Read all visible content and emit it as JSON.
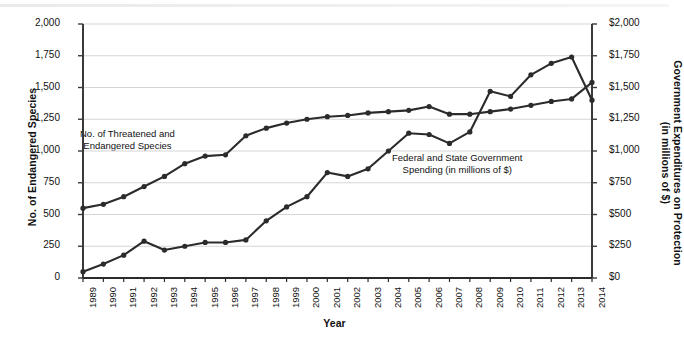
{
  "chart_data": {
    "type": "line",
    "title": "",
    "xlabel": "Year",
    "ylabel": "No. of Endangered Species",
    "ylabel_right": "Government Expenditures on Protection (in millions of $)",
    "grid": true,
    "legend": "inline-annotations",
    "ylim": [
      0,
      2000
    ],
    "ylim_right": [
      0,
      2000
    ],
    "ytick_labels": [
      "2,000",
      "1,750",
      "1,500",
      "1,250",
      "1,000",
      "750",
      "500",
      "250",
      "0"
    ],
    "ytick_values": [
      2000,
      1750,
      1500,
      1250,
      1000,
      750,
      500,
      250,
      0
    ],
    "ytick_labels_right": [
      "$2,000",
      "$1,750",
      "$1,500",
      "$1,250",
      "$1,000",
      "$750",
      "$500",
      "$250",
      "$0"
    ],
    "categories": [
      "1989",
      "1990",
      "1991",
      "1992",
      "1993",
      "1994",
      "1995",
      "1996",
      "1997",
      "1998",
      "1999",
      "2000",
      "2001",
      "2002",
      "2003",
      "2004",
      "2005",
      "2006",
      "2007",
      "2008",
      "2009",
      "2010",
      "2011",
      "2012",
      "2013",
      "2014"
    ],
    "x": [
      1989,
      1990,
      1991,
      1992,
      1993,
      1994,
      1995,
      1996,
      1997,
      1998,
      1999,
      2000,
      2001,
      2002,
      2003,
      2004,
      2005,
      2006,
      2007,
      2008,
      2009,
      2010,
      2011,
      2012,
      2013,
      2014
    ],
    "series": [
      {
        "name": "No. of Threatened and Endangered Species",
        "annotation": "No. of Threatened and\nEndangered Species",
        "color": "#2b2b2b",
        "axis": "left",
        "values": [
          550,
          580,
          640,
          720,
          800,
          900,
          960,
          970,
          1120,
          1180,
          1220,
          1250,
          1270,
          1280,
          1300,
          1310,
          1320,
          1350,
          1290,
          1290,
          1310,
          1330,
          1360,
          1390,
          1410,
          1540
        ]
      },
      {
        "name": "Federal and State Government Spending (in millions of $)",
        "annotation": "Federal and State Government\nSpending (in millions of $)",
        "color": "#2b2b2b",
        "axis": "right",
        "values": [
          50,
          110,
          180,
          290,
          220,
          250,
          280,
          280,
          300,
          450,
          560,
          640,
          830,
          800,
          860,
          1000,
          1140,
          1130,
          1060,
          1150,
          1470,
          1430,
          1600,
          1690,
          1740,
          1400
        ]
      }
    ],
    "annotations": [
      {
        "id": "annot-species",
        "line1": "No. of Threatened and",
        "line2": "Endangered Species"
      },
      {
        "id": "annot-spending",
        "line1": "Federal and State Government",
        "line2": "Spending (in millions of $)"
      }
    ]
  },
  "axis": {
    "left_title": "No. of Endangered Species",
    "right_title_line1": "Government Expenditures on Protection",
    "right_title_line2": "(in millions of $)",
    "x_title": "Year"
  }
}
